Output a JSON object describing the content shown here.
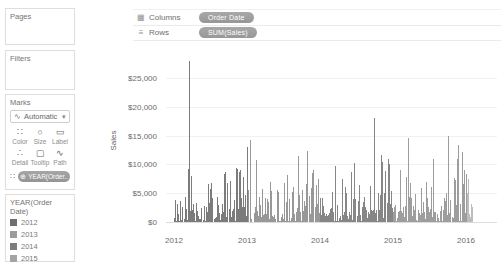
{
  "window": {
    "width": 501,
    "height": 267,
    "bg": "#ffffff"
  },
  "shelves": {
    "columns": {
      "label": "Columns",
      "pill": "Order Date"
    },
    "rows": {
      "label": "Rows",
      "pill": "SUM(Sales)"
    },
    "pill_color": "#9e9e9e",
    "icons": {
      "columns_glyph": "▦",
      "rows_glyph": "≡"
    }
  },
  "cards": {
    "pages": {
      "title": "Pages"
    },
    "filters": {
      "title": "Filters"
    },
    "marks": {
      "title": "Marks",
      "type_selector": {
        "value": "Automatic",
        "icon_glyph": "∿",
        "caret": "▾"
      },
      "buttons": [
        {
          "label": "Color",
          "glyph": "∷"
        },
        {
          "label": "Size",
          "glyph": "○"
        },
        {
          "label": "Label",
          "glyph": "▭"
        },
        {
          "label": "Detail",
          "glyph": "∴"
        },
        {
          "label": "Tooltip",
          "glyph": "▢"
        },
        {
          "label": "Path",
          "glyph": "∿"
        }
      ],
      "color_shelf": {
        "icon_glyph": "∷",
        "pill_icon": "⊕",
        "pill_label": "YEAR(Order.."
      }
    },
    "legend": {
      "title": "YEAR(Order Date)",
      "items": [
        {
          "label": "2012",
          "color": "#6f6f6f"
        },
        {
          "label": "2013",
          "color": "#9c9c9c"
        },
        {
          "label": "2014",
          "color": "#7d7d7d"
        },
        {
          "label": "2015",
          "color": "#a4a4a4"
        }
      ]
    }
  },
  "chart_data": {
    "type": "bar",
    "title": "",
    "xlabel": "",
    "ylabel": "Sales",
    "granularity": "daily",
    "x_ticks": [
      "2012",
      "2013",
      "2014",
      "2015",
      "2016"
    ],
    "y_ticks": [
      "$0",
      "$5,000",
      "$10,000",
      "$15,000",
      "$20,000",
      "$25,000"
    ],
    "ylim": [
      0,
      28500
    ],
    "x_range_years": [
      2012.0,
      2016.09
    ],
    "grid": true,
    "legend_position": "left-card",
    "series": [
      {
        "name": "2012",
        "year": 2012,
        "color": "#7b7b7b"
      },
      {
        "name": "2013",
        "year": 2013,
        "color": "#989898"
      },
      {
        "name": "2014",
        "year": 2014,
        "color": "#868686"
      },
      {
        "name": "2015",
        "year": 2015,
        "color": "#9d9d9d"
      },
      {
        "name": "2016",
        "year": 2016,
        "color": "#bdbdbd"
      }
    ],
    "peaks": [
      {
        "t": 2012.21,
        "value": 28000
      },
      {
        "t": 2012.46,
        "value": 6600
      },
      {
        "t": 2012.68,
        "value": 8300
      },
      {
        "t": 2012.86,
        "value": 9200
      },
      {
        "t": 2012.94,
        "value": 7800
      },
      {
        "t": 2013.04,
        "value": 14200
      },
      {
        "t": 2013.12,
        "value": 10800
      },
      {
        "t": 2013.32,
        "value": 6900
      },
      {
        "t": 2013.55,
        "value": 8200
      },
      {
        "t": 2013.7,
        "value": 11400
      },
      {
        "t": 2013.82,
        "value": 12300
      },
      {
        "t": 2013.91,
        "value": 9100
      },
      {
        "t": 2014.21,
        "value": 9800
      },
      {
        "t": 2014.47,
        "value": 10200
      },
      {
        "t": 2014.74,
        "value": 18000
      },
      {
        "t": 2014.85,
        "value": 10500
      },
      {
        "t": 2014.93,
        "value": 11000
      },
      {
        "t": 2015.1,
        "value": 9000
      },
      {
        "t": 2015.21,
        "value": 14500
      },
      {
        "t": 2015.55,
        "value": 11000
      },
      {
        "t": 2015.76,
        "value": 15000
      },
      {
        "t": 2015.89,
        "value": 13300
      },
      {
        "t": 2015.95,
        "value": 12100
      },
      {
        "t": 2016.03,
        "value": 7500
      }
    ],
    "noise": {
      "seed": 20160109,
      "step_px": 0.7,
      "month_factors": [
        0.75,
        0.6,
        0.95,
        0.8,
        0.7,
        0.85,
        0.8,
        0.75,
        1.1,
        0.9,
        1.15,
        1.25
      ],
      "tiers": [
        {
          "p": 0.1,
          "min": 30,
          "max": 180
        },
        {
          "p": 0.55,
          "min": 150,
          "max": 2600
        },
        {
          "p": 0.84,
          "min": 2600,
          "max": 5600
        },
        {
          "p": 0.965,
          "min": 5600,
          "max": 8400
        },
        {
          "p": 1.0,
          "min": 8400,
          "max": 10500
        }
      ]
    }
  }
}
